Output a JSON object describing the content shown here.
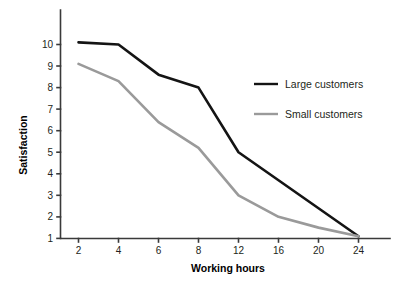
{
  "chart_data": {
    "type": "line",
    "title": "",
    "xlabel": "Working hours",
    "ylabel": "Satisfaction",
    "categories": [
      "2",
      "4",
      "6",
      "8",
      "12",
      "16",
      "20",
      "24"
    ],
    "x": [
      2,
      4,
      6,
      8,
      12,
      16,
      20,
      24
    ],
    "yticks": [
      "1",
      "2",
      "3",
      "4",
      "5",
      "6",
      "7",
      "8",
      "9",
      "10"
    ],
    "ylim": [
      1,
      10
    ],
    "grid": false,
    "legend_position": "upper right",
    "series": [
      {
        "name": "Large customers",
        "color": "#141414",
        "values": [
          10.1,
          10.0,
          8.6,
          8.0,
          5.0,
          3.7,
          2.4,
          1.1
        ]
      },
      {
        "name": "Small customers",
        "color": "#9a9a9a",
        "values": [
          9.1,
          8.3,
          6.4,
          5.2,
          3.0,
          2.0,
          1.5,
          1.1
        ]
      }
    ]
  },
  "axes": {
    "x_title": "Working hours",
    "y_title": "Satisfaction",
    "x_ticks": [
      "2",
      "4",
      "6",
      "8",
      "12",
      "16",
      "20",
      "24"
    ],
    "y_ticks": [
      "10",
      "9",
      "8",
      "7",
      "6",
      "5",
      "4",
      "3",
      "2",
      "1"
    ]
  },
  "legend": {
    "entries": [
      {
        "label": "Large customers",
        "color": "#141414"
      },
      {
        "label": "Small customers",
        "color": "#9a9a9a"
      }
    ]
  },
  "colors": {
    "background": "#ffffff",
    "axis": "#3a3a3a",
    "text": "#231f20",
    "series_large": "#141414",
    "series_small": "#9a9a9a"
  }
}
